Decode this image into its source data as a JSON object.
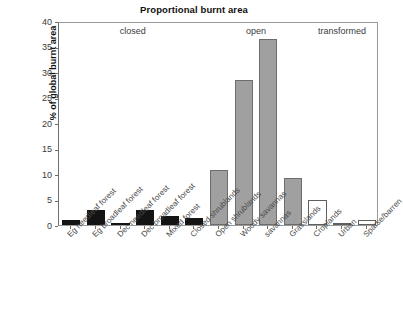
{
  "chart_data": {
    "type": "bar",
    "title": "Proportional burnt area",
    "xlabel": "",
    "ylabel": "% of global burnt area",
    "ylim": [
      0,
      40
    ],
    "yticks": [
      0,
      5,
      10,
      15,
      20,
      25,
      30,
      35,
      40
    ],
    "grid": false,
    "legend": "none",
    "group_annotations": [
      {
        "label": "closed",
        "covers": [
          "Eg needleaf forest",
          "Eg broadleaf forest",
          "Dec needleaf forest",
          "Dec broadleaf forest",
          "Mixed forest",
          "Closed shrublands"
        ]
      },
      {
        "label": "open",
        "covers": [
          "Open shrublands",
          "Woody savannas",
          "savannas",
          "Grasslands"
        ]
      },
      {
        "label": "transformed",
        "covers": [
          "Croplands",
          "Urban",
          "Sparse/barren"
        ]
      }
    ],
    "categories": [
      "Eg needleaf forest",
      "Eg broadleaf forest",
      "Dec needleaf forest",
      "Dec broadleaf forest",
      "Mixed forest",
      "Closed shrublands",
      "Open shrublands",
      "Woody savannas",
      "savannas",
      "Grasslands",
      "Croplands",
      "Urban",
      "Sparse/barren"
    ],
    "values": [
      1.0,
      2.9,
      0.4,
      2.9,
      1.7,
      1.3,
      10.7,
      28.5,
      36.5,
      9.2,
      4.9,
      0.3,
      1.0
    ],
    "bar_styles": [
      "closed",
      "closed",
      "closed",
      "closed",
      "closed",
      "closed",
      "open",
      "open",
      "open",
      "open",
      "transformed",
      "transformed",
      "transformed"
    ],
    "style_colors": {
      "closed_fill": "#141414",
      "open_fill": "#a0a0a0",
      "transformed_fill": "#ffffff",
      "bar_outline": "#5f5f5f",
      "axis": "#6e6e6e",
      "text": "#1a1a1a"
    }
  }
}
